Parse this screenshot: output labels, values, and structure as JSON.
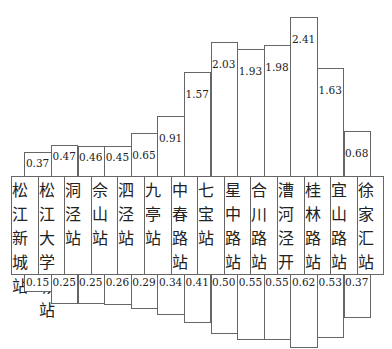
{
  "chart_data": {
    "type": "bar",
    "title": "",
    "stations": [
      "松江新城站",
      "松江大学城站",
      "洞泾站",
      "佘山站",
      "泗泾站",
      "九亭站",
      "中春路站",
      "七宝站",
      "星中路站",
      "合川路站",
      "漕河泾开发区",
      "桂林路站",
      "宜山路站",
      "徐家汇站"
    ],
    "categories": [
      "松江新城站-松江大学城站",
      "松江大学城站-洞泾站",
      "洞泾站-佘山站",
      "佘山站-泗泾站",
      "泗泾站-九亭站",
      "九亭站-中春路站",
      "中春路站-七宝站",
      "七宝站-星中路站",
      "星中路站-合川路站",
      "合川路站-漕河泾开发区",
      "漕河泾开发区-桂林路站",
      "桂林路站-宜山路站",
      "宜山路站-徐家汇站"
    ],
    "series": [
      {
        "name": "upper",
        "values": [
          0.37,
          0.47,
          0.46,
          0.45,
          0.65,
          0.91,
          1.57,
          2.03,
          1.93,
          1.98,
          2.41,
          1.63,
          0.68
        ]
      },
      {
        "name": "lower",
        "values": [
          0.15,
          0.25,
          0.25,
          0.26,
          0.29,
          0.34,
          0.41,
          0.5,
          0.55,
          0.55,
          0.62,
          0.53,
          0.37
        ]
      }
    ],
    "xlabel": "",
    "ylabel": "",
    "grid": false,
    "legend": "none"
  }
}
